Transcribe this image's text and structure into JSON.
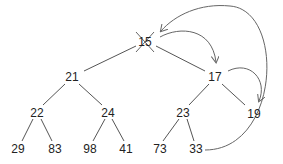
{
  "diagram": {
    "type": "binary-heap-deletion",
    "colors": {
      "edge": "#555555",
      "arrow": "#666666",
      "text": "#222222",
      "cross": "#666666"
    },
    "nodes": [
      {
        "id": "n15",
        "label": "15",
        "x": 145,
        "y": 42,
        "crossed": true
      },
      {
        "id": "n21",
        "label": "21",
        "x": 72,
        "y": 77
      },
      {
        "id": "n17",
        "label": "17",
        "x": 215,
        "y": 77
      },
      {
        "id": "n22",
        "label": "22",
        "x": 37,
        "y": 113
      },
      {
        "id": "n24",
        "label": "24",
        "x": 108,
        "y": 113
      },
      {
        "id": "n23",
        "label": "23",
        "x": 183,
        "y": 113
      },
      {
        "id": "n19",
        "label": "19",
        "x": 254,
        "y": 114
      },
      {
        "id": "n29",
        "label": "29",
        "x": 18,
        "y": 149
      },
      {
        "id": "n83",
        "label": "83",
        "x": 55,
        "y": 149
      },
      {
        "id": "n98",
        "label": "98",
        "x": 90,
        "y": 149
      },
      {
        "id": "n41",
        "label": "41",
        "x": 126,
        "y": 149
      },
      {
        "id": "n73",
        "label": "73",
        "x": 160,
        "y": 149
      },
      {
        "id": "n33",
        "label": "33",
        "x": 196,
        "y": 149
      }
    ],
    "edges": [
      [
        "15",
        "21"
      ],
      [
        "15",
        "17"
      ],
      [
        "21",
        "22"
      ],
      [
        "21",
        "24"
      ],
      [
        "17",
        "23"
      ],
      [
        "17",
        "19"
      ],
      [
        "22",
        "29"
      ],
      [
        "22",
        "83"
      ],
      [
        "24",
        "98"
      ],
      [
        "24",
        "41"
      ],
      [
        "23",
        "73"
      ],
      [
        "23",
        "33"
      ]
    ],
    "arrows": [
      {
        "from": "33",
        "to": "15",
        "description": "last element moved to root"
      },
      {
        "from": "15",
        "to": "17",
        "description": "swap with smaller child"
      },
      {
        "from": "17",
        "to": "19",
        "description": "swap with smaller child"
      }
    ]
  }
}
